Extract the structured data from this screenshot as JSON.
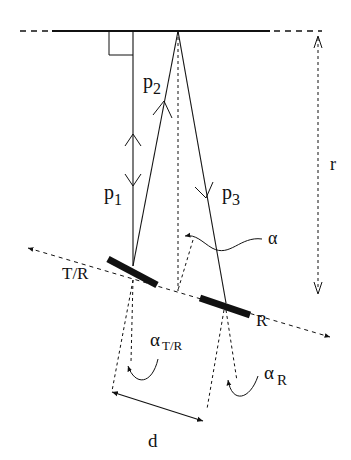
{
  "diagram": {
    "labels": {
      "p1": "p",
      "p1_sub": "1",
      "p2": "p",
      "p2_sub": "2",
      "p3": "p",
      "p3_sub": "3",
      "r": "r",
      "alpha": "α",
      "tr": "T/R",
      "r_node": "R",
      "alpha_tr": "α",
      "alpha_tr_sub": "T/R",
      "alpha_r": "α",
      "alpha_r_sub": "R",
      "d": "d"
    },
    "colors": {
      "stroke": "#111111",
      "background": "#ffffff"
    }
  }
}
